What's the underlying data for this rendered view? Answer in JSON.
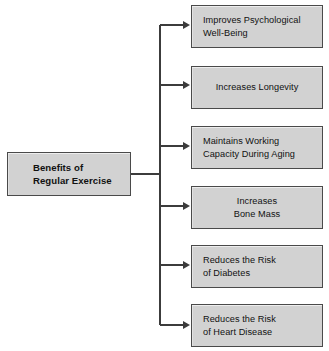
{
  "diagram": {
    "title": "Benefits of Regular Exercise",
    "type": "tree-flowchart",
    "root": {
      "label": "Benefits of\nRegular Exercise"
    },
    "branches": [
      {
        "label": "Improves Psychological\nWell-Being",
        "align": "left"
      },
      {
        "label": "Increases Longevity",
        "align": "center"
      },
      {
        "label": "Maintains Working\nCapacity During Aging",
        "align": "left"
      },
      {
        "label": "Increases\nBone Mass",
        "align": "center"
      },
      {
        "label": "Reduces the Risk\nof Diabetes",
        "align": "left"
      },
      {
        "label": "Reduces the Risk\nof Heart Disease",
        "align": "left"
      }
    ],
    "colors": {
      "box_fill": "#d2d2d2",
      "box_border": "#4a4a4a",
      "connector": "#3c3c3c",
      "background": "#ffffff",
      "text": "#111111"
    }
  }
}
